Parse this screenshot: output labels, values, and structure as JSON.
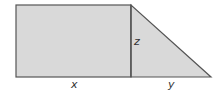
{
  "diagram": {
    "colors": {
      "fill": "#d9d9d9",
      "stroke": "#555555",
      "label": "#333333"
    },
    "shapes": {
      "rectangle": {
        "x": 16,
        "y": 5,
        "width": 115,
        "height": 72
      },
      "triangle": {
        "points": "131,5 131,77 211,77"
      }
    },
    "labels": {
      "x": "x",
      "y": "y",
      "z": "z"
    }
  }
}
